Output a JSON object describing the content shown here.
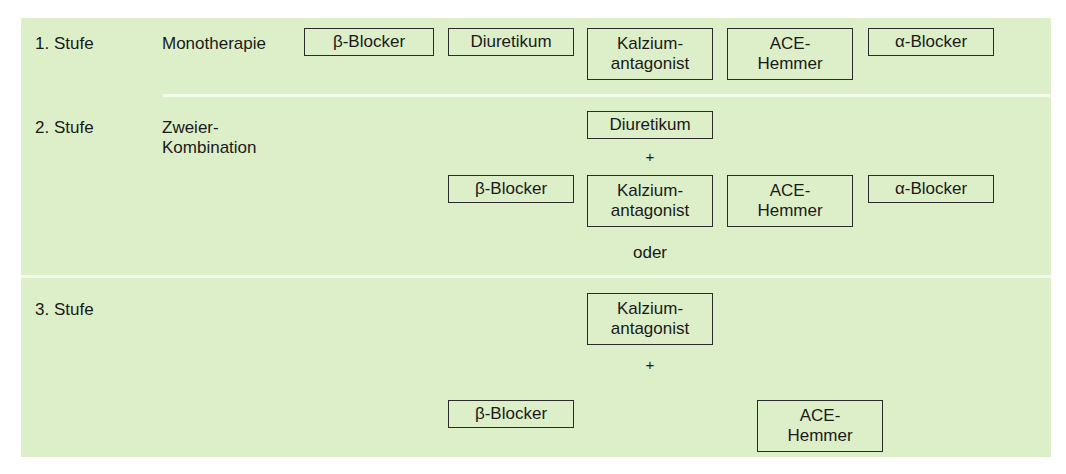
{
  "stages": [
    {
      "label": "1. Stufe",
      "sublabel": "Monotherapie",
      "boxes": [
        {
          "text": "β-Blocker"
        },
        {
          "text": "Diuretikum"
        },
        {
          "text": "Kalzium-\nantagonist"
        },
        {
          "text": "ACE-\nHemmer"
        },
        {
          "text": "α-Blocker"
        }
      ]
    },
    {
      "label": "2. Stufe",
      "sublabel": "Zweier-\nKombination",
      "top_box": {
        "text": "Diuretikum"
      },
      "plus": "+",
      "boxes": [
        {
          "text": "β-Blocker"
        },
        {
          "text": "Kalzium-\nantagonist"
        },
        {
          "text": "ACE-\nHemmer"
        },
        {
          "text": "α-Blocker"
        }
      ],
      "footer": "oder"
    },
    {
      "label": "3. Stufe",
      "top_box": {
        "text": "Kalzium-\nantagonist"
      },
      "plus": "+",
      "boxes": [
        {
          "text": "β-Blocker"
        },
        {
          "text": "ACE-\nHemmer"
        }
      ]
    }
  ],
  "colors": {
    "panel_bg": "#dcefc8",
    "divider": "#f4faee",
    "box_border": "#2b2b2b"
  }
}
